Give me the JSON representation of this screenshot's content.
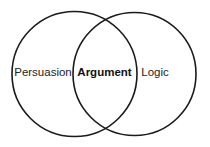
{
  "diagram": {
    "type": "venn",
    "sets": [
      {
        "id": "left",
        "label": "Persuasion"
      },
      {
        "id": "right",
        "label": "Logic"
      }
    ],
    "intersection": {
      "sets": [
        "left",
        "right"
      ],
      "label": "Argument",
      "emphasis": "bold"
    },
    "stroke_color": "#1a1a1a",
    "text_color": "#222222",
    "background": "#ffffff"
  }
}
